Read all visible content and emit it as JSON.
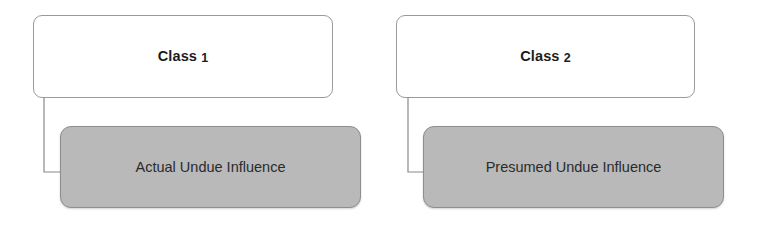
{
  "diagram": {
    "type": "hierarchy-diagram",
    "background_color": "#ffffff",
    "colors": {
      "class_box_fill": "#ffffff",
      "class_box_border": "#9a9a9a",
      "influence_box_fill": "#b9b9b9",
      "influence_box_border": "#8e8e8e",
      "connector_line": "#8a8a8a",
      "class_text": "#1c1c1c",
      "influence_text": "#2b2b2b"
    },
    "groups": [
      {
        "id": "class-1",
        "class_label_text": "Class",
        "class_label_number": "1",
        "class_label_full": "Class 1",
        "influence_label": "Actual Undue Influence",
        "class_box": {
          "x": 33,
          "y": 15,
          "w": 300,
          "h": 83
        },
        "influence_box": {
          "x": 60,
          "y": 126,
          "w": 301,
          "h": 82
        },
        "connector": {
          "x": 44,
          "y": 97,
          "drop": 76,
          "run": 17
        }
      },
      {
        "id": "class-2",
        "class_label_text": "Class",
        "class_label_number": "2",
        "class_label_full": "Class 2",
        "influence_label": "Presumed Undue Influence",
        "class_box": {
          "x": 396,
          "y": 15,
          "w": 299,
          "h": 83
        },
        "influence_box": {
          "x": 423,
          "y": 126,
          "w": 301,
          "h": 82
        },
        "connector": {
          "x": 408,
          "y": 97,
          "drop": 76,
          "run": 16
        }
      }
    ]
  }
}
